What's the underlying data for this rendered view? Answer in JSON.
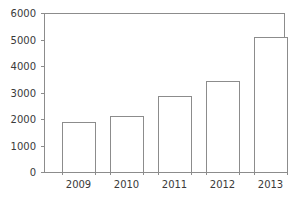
{
  "chart_data": {
    "type": "bar",
    "title": "",
    "subtitle": "",
    "xlabel": "",
    "ylabel": "",
    "categories": [
      "2009",
      "2010",
      "2011",
      "2012",
      "2013"
    ],
    "values": [
      1900,
      2100,
      2850,
      3450,
      5080
    ],
    "series": [
      {
        "name": "",
        "values": [
          1900,
          2100,
          2850,
          3450,
          5080
        ]
      }
    ],
    "ylim": [
      0,
      6000
    ],
    "yticks": [
      0,
      1000,
      2000,
      3000,
      4000,
      5000,
      6000
    ],
    "ytick_labels": [
      "0",
      "1000",
      "2000",
      "3000",
      "4000",
      "5000",
      "6000"
    ],
    "xtick_labels": [
      "2009",
      "2010",
      "2011",
      "2012",
      "2013"
    ],
    "grid": false,
    "legend": false,
    "legend_position": "none",
    "annotations": [],
    "bar_style": {
      "fill": "#ffffff",
      "edge": "#8c8c8c"
    },
    "axis_color": "#8c8c8c",
    "text_color": "#3a3a3a",
    "background": "#ffffff"
  },
  "layout": {
    "plot_left": 44,
    "plot_right": 284,
    "plot_top": 13,
    "plot_bottom": 172,
    "bar_width": 33,
    "bar_gap": 15,
    "first_bar_left": 62,
    "tick_length": 3,
    "ytick_label_gap": 5,
    "xtick_label_gap": 6
  }
}
